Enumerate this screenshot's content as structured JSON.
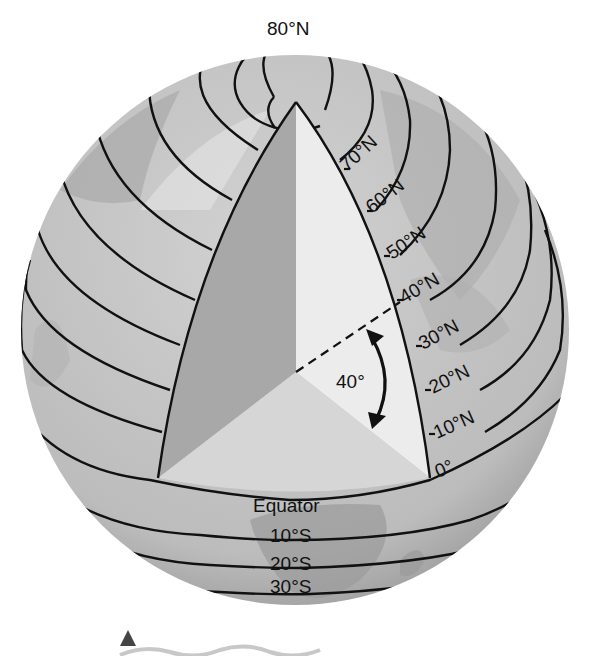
{
  "diagram": {
    "angle_label": "40°",
    "equator_label": "Equator",
    "north_labels": [
      "80°N",
      "70°N",
      "60°N",
      "50°N",
      "40°N",
      "30°N",
      "20°N",
      "10°N",
      "0°"
    ],
    "south_labels": [
      "10°S",
      "20°S",
      "30°S"
    ],
    "colors": {
      "background": "#ffffff",
      "globe": "#c4c4c4",
      "globe_dark": "#9e9e9e",
      "wedge_left": "#a8a8a8",
      "wedge_right": "#ececec",
      "equatorial_plane": "#d6d6d6",
      "lines": "#111111",
      "marker": "#444444",
      "wave": "#c8c8c8"
    },
    "decor": {
      "marker": "triangle",
      "wave": "wavy-line"
    }
  }
}
